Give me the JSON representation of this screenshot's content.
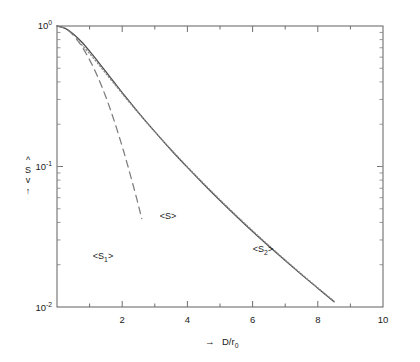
{
  "figure": {
    "background": "#ffffff",
    "frame_color": "#6e6e6e",
    "curve_color": "#4a4a4a"
  },
  "axes": {
    "y": {
      "label_chars": [
        "^",
        "S",
        "v"
      ],
      "label_text": "<S>",
      "arrow": "↑",
      "tick_labels": [
        "10",
        "10"
      ],
      "tick_exponents": [
        "0",
        "-2"
      ],
      "tick_label_top": "10",
      "tick_exp_top": "0",
      "tick_label_mid": "10",
      "tick_exp_mid": "-1",
      "tick_label_bot": "10",
      "tick_exp_bot": "-2"
    },
    "x": {
      "arrow": "→",
      "label_main": "D/r",
      "label_sub": "0",
      "tick_labels": [
        "2",
        "4",
        "6",
        "8",
        "10"
      ]
    }
  },
  "annotations": [
    {
      "id": "s1",
      "main": "<S",
      "sub": "1",
      "tail": ">",
      "x": 103,
      "y": 259
    },
    {
      "id": "s",
      "main": "<S>",
      "sub": "",
      "tail": "",
      "x": 168,
      "y": 219
    },
    {
      "id": "s2",
      "main": "<S",
      "sub": "2",
      "tail": ">",
      "x": 263,
      "y": 252
    }
  ],
  "chart_data": {
    "type": "line",
    "title": "",
    "xlabel": "→ D/r₀",
    "ylabel": "↑ <S>",
    "xlim": [
      0,
      10
    ],
    "ylim": [
      0.01,
      1
    ],
    "yscale": "log",
    "xscale": "linear",
    "grid": false,
    "legend": "none",
    "xticks": [
      0,
      2,
      4,
      6,
      8,
      10
    ],
    "xtick_labels": [
      "",
      "2",
      "4",
      "6",
      "8",
      "10"
    ],
    "xminorticks": [
      1,
      3,
      5,
      7,
      9
    ],
    "yticks": [
      1,
      0.1,
      0.01
    ],
    "ytick_labels": [
      "10^0",
      "10^-1",
      "10^-2"
    ],
    "series": [
      {
        "name": "<S>",
        "style": "solid",
        "color": "#4a4a4a",
        "x": [
          0,
          0.25,
          0.5,
          0.75,
          1.0,
          1.25,
          1.5,
          1.75,
          2.0,
          2.5,
          3.0,
          3.5,
          4.0,
          4.5,
          5.0,
          5.5,
          6.0,
          6.5,
          7.0,
          7.5,
          8.0,
          8.5,
          9.0,
          9.5,
          10.0
        ],
        "y": [
          1.0,
          0.962,
          0.878,
          0.772,
          0.662,
          0.561,
          0.473,
          0.398,
          0.336,
          0.242,
          0.177,
          0.131,
          0.0985,
          0.0748,
          0.0573,
          0.0443,
          0.0345,
          0.0271,
          0.0214,
          0.017,
          0.0136,
          0.0109,
          0.0088,
          0.0071,
          0.0058
        ]
      },
      {
        "name": "<S1>",
        "style": "dashed",
        "color": "#7d7d7d",
        "x": [
          0,
          0.25,
          0.5,
          0.75,
          1.0,
          1.25,
          1.5,
          1.75,
          2.0,
          2.2,
          2.45,
          2.6
        ],
        "y": [
          1.0,
          0.962,
          0.861,
          0.722,
          0.574,
          0.434,
          0.312,
          0.213,
          0.139,
          0.0958,
          0.0585,
          0.0425
        ]
      },
      {
        "name": "<S2>",
        "style": "dotted",
        "color": "#8a8a8a",
        "x": [
          0.6,
          1.0,
          1.5,
          2.0,
          2.5,
          3.0,
          3.5,
          4.0,
          4.5,
          5.0,
          5.5,
          6.0,
          6.5,
          7.0,
          7.5,
          8.0,
          8.5,
          9.0,
          9.5,
          10.0
        ],
        "y": [
          0.805,
          0.636,
          0.459,
          0.33,
          0.24,
          0.177,
          0.132,
          0.0995,
          0.0757,
          0.058,
          0.0448,
          0.0349,
          0.0274,
          0.0216,
          0.0172,
          0.0137,
          0.011,
          0.0089,
          0.0072,
          0.0059
        ]
      }
    ],
    "annotation_labels": [
      "<S1>",
      "<S>",
      "<S2>"
    ]
  }
}
